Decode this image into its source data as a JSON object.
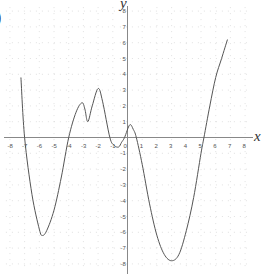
{
  "chart_data": {
    "type": "line",
    "title": "",
    "partial_label": ")",
    "xlabel": "x",
    "ylabel": "y",
    "xlim": [
      -8,
      8
    ],
    "ylim": [
      -8,
      8
    ],
    "grid": true,
    "grid_style": "dotted",
    "x_ticks": [
      -8,
      -7,
      -6,
      -5,
      -4,
      -3,
      -2,
      -1,
      0,
      1,
      2,
      3,
      4,
      5,
      6,
      7,
      8
    ],
    "y_ticks": [
      -8,
      -7,
      -6,
      -5,
      -4,
      -3,
      -2,
      -1,
      1,
      2,
      3,
      4,
      5,
      6,
      7,
      8
    ],
    "series": [
      {
        "name": "f(x)",
        "color": "#555555",
        "x": [
          -7.25,
          -7.0,
          -6.5,
          -6.0,
          -5.8,
          -5.5,
          -5.0,
          -4.5,
          -4.0,
          -3.5,
          -3.1,
          -2.9,
          -2.7,
          -2.4,
          -2.0,
          -1.7,
          -1.2,
          -0.9,
          -0.6,
          -0.4,
          -0.2,
          0.15,
          0.4,
          0.6,
          1.0,
          1.5,
          2.0,
          2.5,
          3.0,
          3.5,
          4.0,
          4.5,
          5.0,
          5.2,
          5.6,
          6.0,
          6.4,
          6.8
        ],
        "y": [
          3.8,
          0.0,
          -3.6,
          -5.8,
          -6.2,
          -5.9,
          -4.6,
          -2.5,
          0.0,
          1.6,
          2.2,
          1.8,
          1.0,
          2.0,
          3.1,
          2.3,
          0.0,
          -0.5,
          -0.6,
          -0.3,
          0.0,
          0.8,
          0.5,
          0.0,
          -1.7,
          -4.2,
          -6.2,
          -7.4,
          -7.8,
          -7.4,
          -5.9,
          -3.8,
          -1.0,
          0.0,
          2.0,
          3.8,
          5.0,
          6.2
        ]
      }
    ],
    "roots": [
      -7,
      -4,
      -1.2,
      -0.2,
      0.6,
      5.2
    ],
    "extrema": [
      {
        "type": "min",
        "x": -5.8,
        "y": -6.2
      },
      {
        "type": "max",
        "x": -3.1,
        "y": 2.2
      },
      {
        "type": "min",
        "x": -2.7,
        "y": 1.0
      },
      {
        "type": "max",
        "x": -2.0,
        "y": 3.1
      },
      {
        "type": "min",
        "x": -0.6,
        "y": -0.6
      },
      {
        "type": "max",
        "x": 0.15,
        "y": 0.8
      },
      {
        "type": "min",
        "x": 3.0,
        "y": -7.8
      }
    ]
  },
  "colors": {
    "axis": "#888888",
    "grid": "#cccccc",
    "curve": "#555555",
    "text": "#555555"
  }
}
